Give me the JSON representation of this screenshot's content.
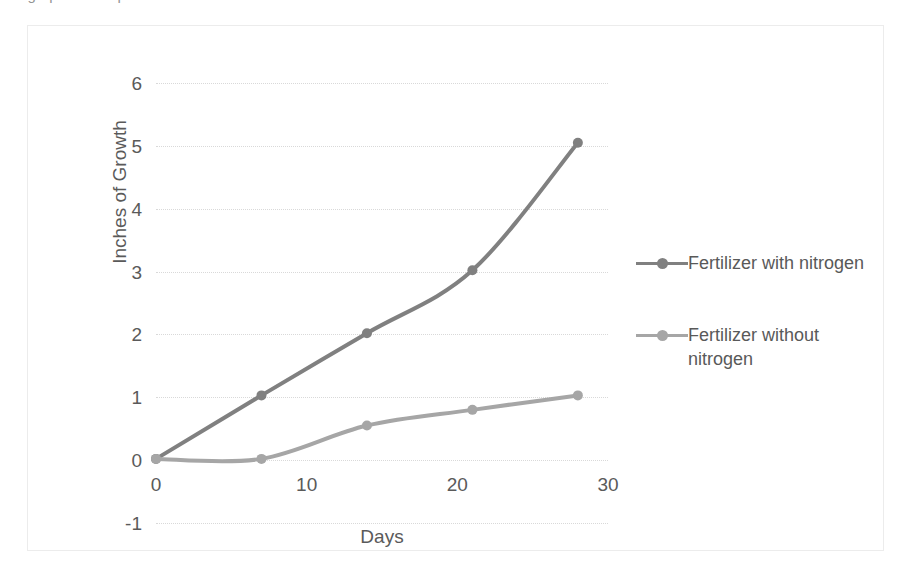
{
  "page": {
    "clipped_title": "Bar graph lesson plan"
  },
  "chart_data": {
    "type": "line",
    "title": "",
    "xlabel": "Days",
    "ylabel": "Inches of Growth",
    "x": [
      0,
      7,
      14,
      21,
      28
    ],
    "xlim": [
      0,
      30
    ],
    "ylim": [
      -1,
      6
    ],
    "xticks": [
      0,
      10,
      20,
      30
    ],
    "xtick_labels": [
      "0",
      "10",
      "20",
      "30"
    ],
    "yticks": [
      -1,
      0,
      1,
      2,
      3,
      4,
      5,
      6
    ],
    "ytick_labels": [
      "-1",
      "0",
      "1",
      "2",
      "3",
      "4",
      "5",
      "6"
    ],
    "grid": "horizontal-dotted",
    "legend_position": "right",
    "series": [
      {
        "name": "Fertilizer with nitrogen",
        "color": "#808080",
        "values": [
          0.02,
          1.03,
          2.02,
          3.02,
          5.05
        ]
      },
      {
        "name": "Fertilizer without nitrogen",
        "color": "#a6a6a6",
        "values": [
          0.02,
          0.02,
          0.55,
          0.8,
          1.03
        ]
      }
    ]
  }
}
